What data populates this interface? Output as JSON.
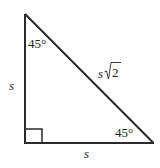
{
  "diagram": {
    "type": "right-triangle-45-45-90",
    "stroke_color": "#2a2a2a",
    "vertices": {
      "top": [
        25,
        14
      ],
      "right_angle": [
        25,
        143
      ],
      "bottom_right": [
        153,
        143
      ]
    },
    "labels": {
      "top_angle": "45°",
      "bottom_right_angle": "45°",
      "left_side_var": "s",
      "bottom_side_var": "s",
      "hypotenuse_var": "s",
      "hypotenuse_radicand": "2"
    },
    "right_angle_marker": true
  }
}
